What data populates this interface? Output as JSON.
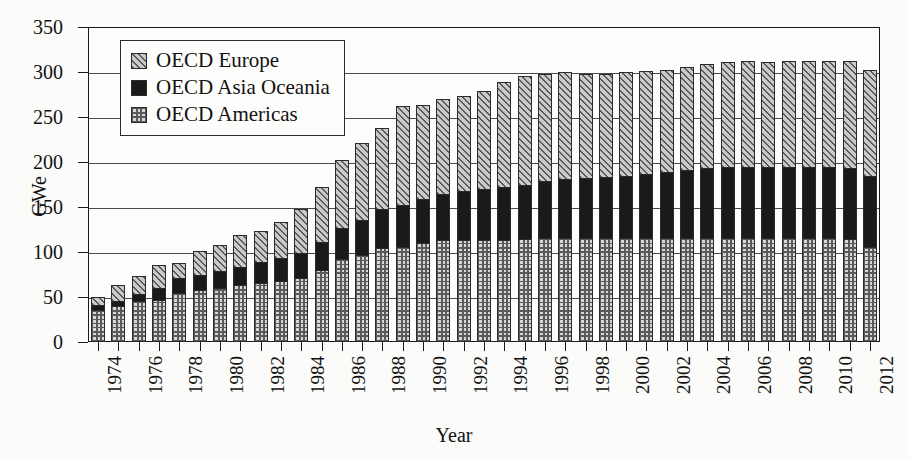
{
  "chart_data": {
    "type": "bar",
    "subtype": "stacked-vertical",
    "title": "",
    "xlabel": "Year",
    "ylabel": "GWe",
    "ylim": [
      0,
      350
    ],
    "ytick_step": 50,
    "yticks": [
      0,
      50,
      100,
      150,
      200,
      250,
      300,
      350
    ],
    "ytick_labels": [
      "0",
      "50",
      "100",
      "150",
      "200",
      "250",
      "300",
      "350"
    ],
    "grid": true,
    "grid_axis": "y",
    "legend_position": "upper-left-inside",
    "x_tick_label_rotation": 90,
    "categories": [
      "1974",
      "1975",
      "1976",
      "1977",
      "1978",
      "1979",
      "1980",
      "1981",
      "1982",
      "1983",
      "1984",
      "1985",
      "1986",
      "1987",
      "1988",
      "1989",
      "1990",
      "1991",
      "1992",
      "1993",
      "1994",
      "1995",
      "1996",
      "1997",
      "1998",
      "1999",
      "2000",
      "2001",
      "2002",
      "2003",
      "2004",
      "2005",
      "2006",
      "2007",
      "2008",
      "2009",
      "2010",
      "2011",
      "2012"
    ],
    "visible_xtick_labels": [
      "1974",
      "1976",
      "1978",
      "1980",
      "1982",
      "1984",
      "1986",
      "1988",
      "1990",
      "1992",
      "1994",
      "1996",
      "1998",
      "2000",
      "2002",
      "2004",
      "2006",
      "2008",
      "2010",
      "2012"
    ],
    "stack_order_bottom_to_top": [
      "OECD Americas",
      "OECD Asia Oceania",
      "OECD Europe"
    ],
    "series": [
      {
        "name": "OECD Americas",
        "pattern": "cross-hatch",
        "color": "#d7d7d7",
        "values": [
          36,
          40,
          46,
          47,
          55,
          58,
          60,
          63,
          66,
          68,
          71,
          80,
          92,
          97,
          105,
          106,
          110,
          113,
          113,
          113,
          113,
          114,
          116,
          116,
          116,
          116,
          116,
          116,
          116,
          116,
          116,
          116,
          116,
          116,
          115,
          115,
          115,
          115,
          105
        ]
      },
      {
        "name": "OECD Asia Oceania",
        "pattern": "solid",
        "color": "#1a1a1a",
        "values": [
          6,
          7,
          8,
          14,
          17,
          18,
          20,
          22,
          24,
          26,
          29,
          32,
          36,
          40,
          44,
          47,
          50,
          53,
          56,
          58,
          60,
          62,
          64,
          66,
          67,
          68,
          70,
          72,
          74,
          76,
          78,
          80,
          80,
          80,
          80,
          80,
          80,
          80,
          80
        ]
      },
      {
        "name": "OECD Europe",
        "pattern": "diagonal-hatch",
        "color": "#c9c9c9",
        "values": [
          10,
          19,
          22,
          27,
          18,
          27,
          30,
          36,
          36,
          42,
          50,
          63,
          77,
          86,
          91,
          112,
          106,
          106,
          107,
          110,
          118,
          122,
          120,
          120,
          117,
          116,
          116,
          115,
          115,
          116,
          117,
          117,
          118,
          117,
          119,
          119,
          119,
          120,
          119
        ]
      }
    ],
    "totals": [
      52,
      66,
      76,
      88,
      90,
      103,
      110,
      121,
      126,
      136,
      150,
      175,
      205,
      223,
      240,
      265,
      266,
      272,
      276,
      281,
      291,
      298,
      300,
      302,
      300,
      300,
      302,
      303,
      305,
      308,
      311,
      313,
      314,
      313,
      314,
      314,
      314,
      315,
      304
    ]
  },
  "legend": {
    "items": [
      {
        "label": "OECD Europe",
        "swatch": "diagonal-hatch-swatch"
      },
      {
        "label": "OECD Asia Oceania",
        "swatch": "solid-black-swatch"
      },
      {
        "label": "OECD Americas",
        "swatch": "cross-hatch-swatch"
      }
    ]
  },
  "axes": {
    "y_title": "GWe",
    "x_title": "Year"
  }
}
